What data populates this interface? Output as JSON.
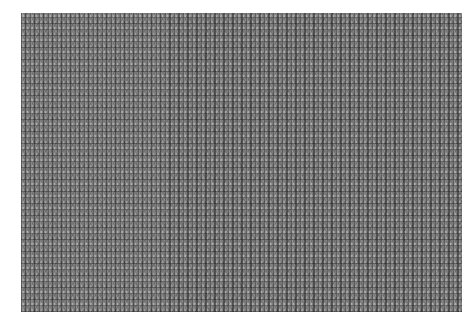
{
  "image": {
    "subject": "knitted fabric texture",
    "description": "Gray knit mesh texture photograph with a white border",
    "colors": {
      "background": "#ffffff",
      "texture_base": "#7a7a7a",
      "texture_dark": "#282828",
      "texture_light": "#e6e6e6"
    }
  }
}
